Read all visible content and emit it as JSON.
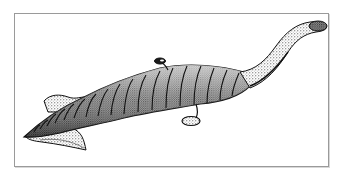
{
  "figure": {
    "style": "black and white stipple drawing",
    "colors": {
      "background": "#ffffff",
      "frame": "#9a9a9a",
      "ink": "#111111",
      "stipple": "#555555"
    },
    "parts": [
      "tail-fin",
      "segmented-body",
      "dorsal-eye-stalk",
      "ventral-eye-stalk",
      "proboscis",
      "claw-head"
    ]
  }
}
